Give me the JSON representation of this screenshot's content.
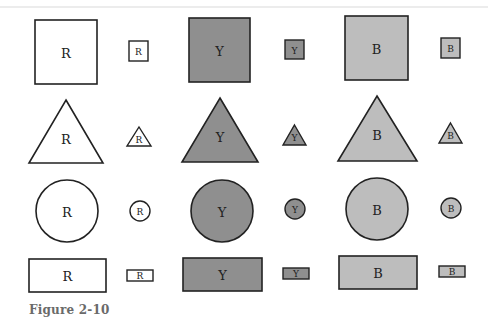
{
  "figure": {
    "caption": "Figure 2-10",
    "colors": {
      "R": "#ffffff",
      "Y": "#8f8f8f",
      "B": "#bdbdbd",
      "stroke": "#222222"
    },
    "rows": [
      {
        "shape": "square",
        "items": [
          {
            "label": "R",
            "size": "large"
          },
          {
            "label": "R",
            "size": "small"
          },
          {
            "label": "Y",
            "size": "large"
          },
          {
            "label": "Y",
            "size": "small"
          },
          {
            "label": "B",
            "size": "large"
          },
          {
            "label": "B",
            "size": "small"
          }
        ]
      },
      {
        "shape": "triangle",
        "items": [
          {
            "label": "R",
            "size": "large"
          },
          {
            "label": "R",
            "size": "small"
          },
          {
            "label": "Y",
            "size": "large"
          },
          {
            "label": "Y",
            "size": "small"
          },
          {
            "label": "B",
            "size": "large"
          },
          {
            "label": "B",
            "size": "small"
          }
        ]
      },
      {
        "shape": "circle",
        "items": [
          {
            "label": "R",
            "size": "large"
          },
          {
            "label": "R",
            "size": "small"
          },
          {
            "label": "Y",
            "size": "large"
          },
          {
            "label": "Y",
            "size": "small"
          },
          {
            "label": "B",
            "size": "large"
          },
          {
            "label": "B",
            "size": "small"
          }
        ]
      },
      {
        "shape": "rectangle",
        "items": [
          {
            "label": "R",
            "size": "large"
          },
          {
            "label": "R",
            "size": "small"
          },
          {
            "label": "Y",
            "size": "large"
          },
          {
            "label": "Y",
            "size": "small"
          },
          {
            "label": "B",
            "size": "large"
          },
          {
            "label": "B",
            "size": "small"
          }
        ]
      }
    ]
  }
}
